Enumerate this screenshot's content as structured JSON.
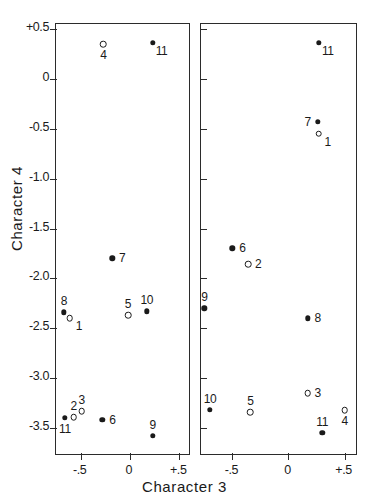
{
  "header_note": "",
  "axes": {
    "xlabel": "Character 3",
    "ylabel": "Character 4",
    "yticks": [
      "+0.5",
      "0",
      "-0.5",
      "-1.0",
      "-1.5",
      "-2.0",
      "-2.5",
      "-3.0",
      "-3.5"
    ],
    "ytick_values": [
      0.5,
      0.0,
      -0.5,
      -1.0,
      -1.5,
      -2.0,
      -2.5,
      -3.0,
      -3.5
    ],
    "xticks": [
      "-.5",
      "0",
      "+.5"
    ],
    "xtick_values": [
      -0.5,
      0.0,
      0.5
    ]
  },
  "chart_data": {
    "type": "scatter",
    "title": "",
    "xlabel": "Character 3",
    "ylabel": "Character 4",
    "xlim": [
      -0.75,
      0.62
    ],
    "ylim": [
      -3.78,
      0.55
    ],
    "grid": false,
    "legend": "none",
    "marker_types": {
      "filled": "filled circle",
      "open": "open circle"
    },
    "panels": [
      {
        "name": "left-panel",
        "xlim": [
          -0.75,
          0.62
        ],
        "points": [
          {
            "label": "4",
            "x": -0.27,
            "y": 0.35,
            "marker": "open",
            "label_pos": "below"
          },
          {
            "label": "11",
            "x": 0.23,
            "y": 0.36,
            "marker": "filled",
            "label_pos": "right-below"
          },
          {
            "label": "7",
            "x": -0.18,
            "y": -1.8,
            "marker": "filled",
            "label_pos": "right"
          },
          {
            "label": "8",
            "x": -0.67,
            "y": -2.34,
            "marker": "filled",
            "label_pos": "above"
          },
          {
            "label": "1",
            "x": -0.61,
            "y": -2.4,
            "marker": "open",
            "label_pos": "right-below"
          },
          {
            "label": "5",
            "x": -0.02,
            "y": -2.37,
            "marker": "open",
            "label_pos": "above"
          },
          {
            "label": "10",
            "x": 0.17,
            "y": -2.33,
            "marker": "filled",
            "label_pos": "above"
          },
          {
            "label": "11",
            "x": -0.66,
            "y": -3.4,
            "marker": "filled",
            "label_pos": "below"
          },
          {
            "label": "2",
            "x": -0.57,
            "y": -3.39,
            "marker": "open",
            "label_pos": "above"
          },
          {
            "label": "3",
            "x": -0.49,
            "y": -3.33,
            "marker": "open",
            "label_pos": "above"
          },
          {
            "label": "6",
            "x": -0.28,
            "y": -3.42,
            "marker": "filled",
            "label_pos": "right"
          },
          {
            "label": "9",
            "x": 0.23,
            "y": -3.58,
            "marker": "filled",
            "label_pos": "above"
          }
        ]
      },
      {
        "name": "right-panel",
        "xlim": [
          -0.78,
          0.62
        ],
        "points": [
          {
            "label": "11",
            "x": 0.27,
            "y": 0.36,
            "marker": "filled",
            "label_pos": "right-below"
          },
          {
            "label": "7",
            "x": 0.26,
            "y": -0.43,
            "marker": "filled",
            "label_pos": "left"
          },
          {
            "label": "1",
            "x": 0.27,
            "y": -0.55,
            "marker": "open",
            "label_pos": "right-below"
          },
          {
            "label": "6",
            "x": -0.5,
            "y": -1.7,
            "marker": "filled",
            "label_pos": "right"
          },
          {
            "label": "2",
            "x": -0.36,
            "y": -1.86,
            "marker": "open",
            "label_pos": "right"
          },
          {
            "label": "9",
            "x": -0.75,
            "y": -2.3,
            "marker": "filled",
            "label_pos": "above"
          },
          {
            "label": "8",
            "x": 0.17,
            "y": -2.4,
            "marker": "filled",
            "label_pos": "right"
          },
          {
            "label": "10",
            "x": -0.7,
            "y": -3.32,
            "marker": "filled",
            "label_pos": "above"
          },
          {
            "label": "5",
            "x": -0.34,
            "y": -3.34,
            "marker": "open",
            "label_pos": "above"
          },
          {
            "label": "3",
            "x": 0.17,
            "y": -3.15,
            "marker": "open",
            "label_pos": "right"
          },
          {
            "label": "4",
            "x": 0.5,
            "y": -3.32,
            "marker": "open",
            "label_pos": "below"
          },
          {
            "label": "11",
            "x": 0.3,
            "y": -3.55,
            "marker": "filled",
            "label_pos": "above"
          }
        ]
      }
    ]
  }
}
